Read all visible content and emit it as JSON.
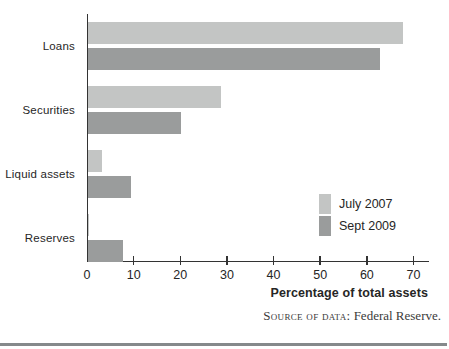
{
  "figure": {
    "xlabel": "Percentage of total assets",
    "source_prefix": "Source of data:",
    "source_text": " Federal Reserve."
  },
  "colors": {
    "series_light": "#c3c5c4",
    "series_dark": "#9a9c9c",
    "axis": "#333333",
    "bottom_rule": "#85898b"
  },
  "legend": {
    "items": [
      {
        "label": "July 2007",
        "color": "#c3c5c4"
      },
      {
        "label": "Sept 2009",
        "color": "#9a9c9c"
      }
    ]
  },
  "chart_data": {
    "type": "bar",
    "orientation": "horizontal",
    "title": "",
    "categories": [
      "Loans",
      "Securities",
      "Liquid assets",
      "Reserves"
    ],
    "series": [
      {
        "name": "July 2007",
        "color": "#c3c5c4",
        "values": [
          67.5,
          28.5,
          3.0,
          0.3
        ]
      },
      {
        "name": "Sept 2009",
        "color": "#9a9c9c",
        "values": [
          62.5,
          20.0,
          9.3,
          7.4
        ]
      }
    ],
    "xlabel": "Percentage of total assets",
    "ylabel": "",
    "xlim": [
      0,
      73
    ],
    "xticks": [
      0,
      10,
      20,
      30,
      40,
      50,
      60,
      70
    ],
    "grid": false,
    "legend_position": "inside-right",
    "source": "Source of data: Federal Reserve."
  }
}
